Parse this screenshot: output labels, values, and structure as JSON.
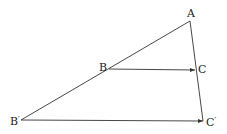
{
  "diagram": {
    "type": "geometry-similar-triangles",
    "points": {
      "A": {
        "label": "A",
        "x": 190,
        "y": 21
      },
      "B": {
        "label": "B",
        "x": 109,
        "y": 69
      },
      "C": {
        "label": "C",
        "x": 195,
        "y": 70
      },
      "B_prime": {
        "label": "B",
        "prime": "′",
        "x": 21,
        "y": 120
      },
      "C_prime": {
        "label": "C",
        "prime": "′",
        "x": 203,
        "y": 121
      }
    },
    "segments": [
      {
        "from": "A",
        "to": "B_prime",
        "arrow": false
      },
      {
        "from": "A",
        "to": "C_prime",
        "arrow": false
      },
      {
        "from": "B",
        "to": "C",
        "arrow": true
      },
      {
        "from": "B_prime",
        "to": "C_prime",
        "arrow": true
      }
    ],
    "colors": {
      "line": "#333333",
      "text": "#222222",
      "background": "#ffffff"
    }
  }
}
